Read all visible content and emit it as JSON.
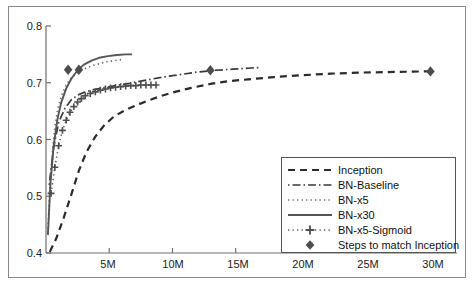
{
  "chart_data": {
    "type": "line",
    "title": "",
    "xlabel": "",
    "ylabel": "",
    "xlim": [
      0,
      32.5
    ],
    "ylim": [
      0.4,
      0.8
    ],
    "grid": false,
    "legend_position": "bottom-right",
    "xticks": [
      "5M",
      "10M",
      "15M",
      "20M",
      "25M",
      "30M"
    ],
    "xtick_values": [
      5,
      10,
      15,
      20,
      25,
      30
    ],
    "yticks": [
      "0.4",
      "0.5",
      "0.6",
      "0.7",
      "0.8"
    ],
    "ytick_values": [
      0.4,
      0.5,
      0.6,
      0.7,
      0.8
    ],
    "series": [
      {
        "name": "Inception",
        "style": "dashed",
        "color": "#2b2b2b",
        "x": [
          0.3,
          0.8,
          1.4,
          2.0,
          2.6,
          3.2,
          3.9,
          4.6,
          5.4,
          6.2,
          7.0,
          8.0,
          9.0,
          10.2,
          11.5,
          13.0,
          14.5,
          16.0,
          18.0,
          20.0,
          22.5,
          25.0,
          27.5,
          30.0,
          30.5
        ],
        "y": [
          0.402,
          0.425,
          0.462,
          0.503,
          0.545,
          0.578,
          0.605,
          0.625,
          0.641,
          0.651,
          0.659,
          0.668,
          0.676,
          0.684,
          0.691,
          0.698,
          0.703,
          0.706,
          0.71,
          0.713,
          0.716,
          0.718,
          0.719,
          0.72,
          0.72
        ]
      },
      {
        "name": "BN-Baseline",
        "style": "dashdot",
        "color": "#3a3a3a",
        "x": [
          0.25,
          0.6,
          1.0,
          1.5,
          2.0,
          2.5,
          3.0,
          3.6,
          4.3,
          5.0,
          5.8,
          6.6,
          7.5,
          8.5,
          9.5,
          10.8,
          12.0,
          13.4,
          14.8,
          16.2,
          17.0
        ],
        "y": [
          0.52,
          0.585,
          0.63,
          0.655,
          0.67,
          0.678,
          0.683,
          0.687,
          0.69,
          0.693,
          0.696,
          0.699,
          0.703,
          0.707,
          0.711,
          0.715,
          0.719,
          0.722,
          0.724,
          0.726,
          0.727
        ]
      },
      {
        "name": "BN-x5",
        "style": "dotted",
        "color": "#6b6b6b",
        "x": [
          0.15,
          0.3,
          0.5,
          0.7,
          0.95,
          1.2,
          1.5,
          1.8,
          2.1,
          2.5,
          2.9,
          3.3,
          3.8,
          4.3,
          4.8,
          5.4,
          6.0
        ],
        "y": [
          0.435,
          0.512,
          0.575,
          0.622,
          0.655,
          0.676,
          0.692,
          0.703,
          0.711,
          0.718,
          0.723,
          0.727,
          0.731,
          0.734,
          0.737,
          0.739,
          0.741
        ]
      },
      {
        "name": "BN-x30",
        "style": "solid",
        "color": "#555555",
        "x": [
          0.15,
          0.35,
          0.6,
          0.9,
          1.2,
          1.6,
          2.0,
          2.5,
          3.0,
          3.6,
          4.2,
          4.9,
          5.6,
          6.3,
          6.8
        ],
        "y": [
          0.432,
          0.522,
          0.588,
          0.635,
          0.665,
          0.69,
          0.707,
          0.722,
          0.732,
          0.739,
          0.744,
          0.747,
          0.749,
          0.75,
          0.75
        ]
      },
      {
        "name": "BN-x5-Sigmoid",
        "style": "dotted-plus",
        "color": "#5a5a5a",
        "x": [
          0.4,
          0.7,
          1.0,
          1.3,
          1.6,
          1.9,
          2.2,
          2.5,
          2.8,
          3.1,
          3.5,
          3.9,
          4.3,
          4.7,
          5.1,
          5.5,
          5.9,
          6.3,
          6.7,
          7.1,
          7.5,
          7.9,
          8.3,
          8.7
        ],
        "y": [
          0.505,
          0.551,
          0.589,
          0.616,
          0.634,
          0.648,
          0.658,
          0.666,
          0.672,
          0.677,
          0.681,
          0.684,
          0.687,
          0.689,
          0.691,
          0.692,
          0.693,
          0.694,
          0.695,
          0.695,
          0.696,
          0.696,
          0.696,
          0.696
        ]
      }
    ],
    "markers": {
      "name": "Steps to match Inception",
      "symbol": "diamond",
      "color": "#4d4d4d",
      "points": [
        {
          "x": 1.75,
          "y": 0.723,
          "series": "BN-x5"
        },
        {
          "x": 2.6,
          "y": 0.723,
          "series": "BN-x30"
        },
        {
          "x": 13.0,
          "y": 0.722,
          "series": "BN-Baseline"
        },
        {
          "x": 30.4,
          "y": 0.72,
          "series": "Inception"
        }
      ]
    },
    "legend": [
      {
        "label": "Inception",
        "style": "dashed"
      },
      {
        "label": "BN-Baseline",
        "style": "dashdot"
      },
      {
        "label": "BN-x5",
        "style": "dotted"
      },
      {
        "label": "BN-x30",
        "style": "solid"
      },
      {
        "label": "BN-x5-Sigmoid",
        "style": "dotted-plus"
      },
      {
        "label": "Steps to match Inception",
        "style": "diamond"
      }
    ]
  },
  "axis": {
    "y_labels": [
      "0.8",
      "0.7",
      "0.6",
      "0.5",
      "0.4"
    ],
    "x_labels": [
      "5M",
      "10M",
      "15M",
      "20M",
      "25M",
      "30M"
    ]
  },
  "legend": {
    "items": [
      "Inception",
      "BN-Baseline",
      "BN-x5",
      "BN-x30",
      "BN-x5-Sigmoid",
      "Steps to match Inception"
    ]
  },
  "colors": {
    "axis": "#6f6f6f",
    "frame": "#8a8a8a",
    "text": "#1a1a1a",
    "inception": "#2b2b2b",
    "bn_baseline": "#3a3a3a",
    "bn_x5": "#6b6b6b",
    "bn_x30": "#555555",
    "bn_x5_sigmoid": "#5a5a5a",
    "marker": "#4d4d4d"
  }
}
